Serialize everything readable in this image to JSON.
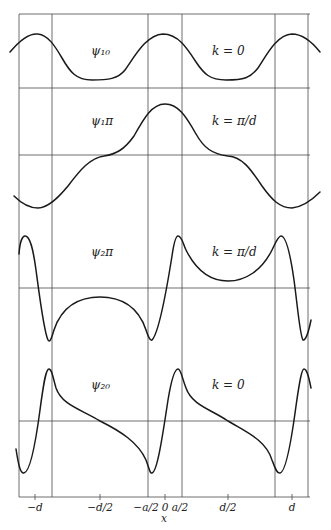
{
  "figure": {
    "panels": [
      {
        "id": "psi10",
        "wavefunction_label": "ψ₁₀",
        "k_label": "k = 0"
      },
      {
        "id": "psi1pi",
        "wavefunction_label": "ψ₁π",
        "k_label": "k = π/d"
      },
      {
        "id": "psi2pi",
        "wavefunction_label": "ψ₂π",
        "k_label": "k = π/d"
      },
      {
        "id": "psi20",
        "wavefunction_label": "ψ₂₀",
        "k_label": "k = 0"
      }
    ],
    "x_axis": {
      "label": "x",
      "ticks": [
        "−d",
        "−d/2",
        "−a/2",
        "0",
        "a/2",
        "d/2",
        "d"
      ]
    }
  },
  "colors": {
    "line": "#1a1a1a",
    "grid": "#4a4a4a",
    "background": "#ffffff"
  }
}
